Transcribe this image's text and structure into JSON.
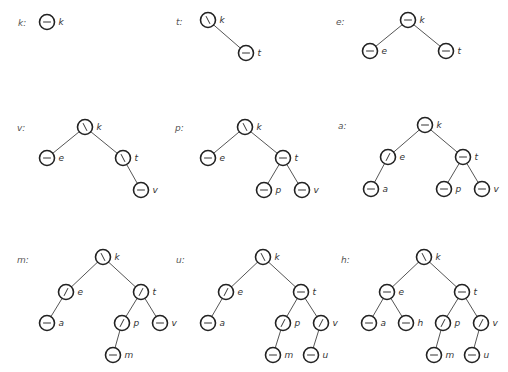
{
  "figure": {
    "balance_glyphs": {
      "balanced": "—",
      "left_heavy": "\\",
      "right_heavy": "/"
    },
    "panels": [
      {
        "label": "k:",
        "label_pos": [
          18,
          23
        ],
        "nodes": [
          {
            "key": "k",
            "x": 47,
            "y": 22,
            "balance": "balanced"
          }
        ],
        "edges": []
      },
      {
        "label": "t:",
        "label_pos": [
          176,
          22
        ],
        "nodes": [
          {
            "key": "k",
            "x": 208,
            "y": 20,
            "balance": "left_heavy"
          },
          {
            "key": "t",
            "x": 246,
            "y": 53,
            "balance": "balanced"
          }
        ],
        "edges": [
          [
            "k",
            "t"
          ]
        ]
      },
      {
        "label": "e:",
        "label_pos": [
          336,
          22
        ],
        "nodes": [
          {
            "key": "k",
            "x": 408,
            "y": 20,
            "balance": "balanced"
          },
          {
            "key": "e",
            "x": 370,
            "y": 51,
            "balance": "balanced"
          },
          {
            "key": "t",
            "x": 446,
            "y": 51,
            "balance": "balanced"
          }
        ],
        "edges": [
          [
            "k",
            "e"
          ],
          [
            "k",
            "t"
          ]
        ]
      },
      {
        "label": "v:",
        "label_pos": [
          17,
          128
        ],
        "nodes": [
          {
            "key": "k",
            "x": 85,
            "y": 127,
            "balance": "left_heavy"
          },
          {
            "key": "e",
            "x": 47,
            "y": 158,
            "balance": "balanced"
          },
          {
            "key": "t",
            "x": 123,
            "y": 158,
            "balance": "left_heavy"
          },
          {
            "key": "v",
            "x": 141,
            "y": 190,
            "balance": "balanced"
          }
        ],
        "edges": [
          [
            "k",
            "e"
          ],
          [
            "k",
            "t"
          ],
          [
            "t",
            "v"
          ]
        ]
      },
      {
        "label": "p:",
        "label_pos": [
          175,
          128
        ],
        "nodes": [
          {
            "key": "k",
            "x": 245,
            "y": 127,
            "balance": "left_heavy"
          },
          {
            "key": "e",
            "x": 208,
            "y": 158,
            "balance": "balanced"
          },
          {
            "key": "t",
            "x": 283,
            "y": 158,
            "balance": "balanced"
          },
          {
            "key": "p",
            "x": 264,
            "y": 190,
            "balance": "balanced"
          },
          {
            "key": "v",
            "x": 302,
            "y": 190,
            "balance": "balanced"
          }
        ],
        "edges": [
          [
            "k",
            "e"
          ],
          [
            "k",
            "t"
          ],
          [
            "t",
            "p"
          ],
          [
            "t",
            "v"
          ]
        ]
      },
      {
        "label": "a:",
        "label_pos": [
          338,
          126
        ],
        "nodes": [
          {
            "key": "k",
            "x": 425,
            "y": 125,
            "balance": "balanced"
          },
          {
            "key": "e",
            "x": 388,
            "y": 157,
            "balance": "right_heavy"
          },
          {
            "key": "t",
            "x": 463,
            "y": 157,
            "balance": "balanced"
          },
          {
            "key": "a",
            "x": 371,
            "y": 189,
            "balance": "balanced"
          },
          {
            "key": "p",
            "x": 444,
            "y": 189,
            "balance": "balanced"
          },
          {
            "key": "v",
            "x": 482,
            "y": 189,
            "balance": "balanced"
          }
        ],
        "edges": [
          [
            "k",
            "e"
          ],
          [
            "k",
            "t"
          ],
          [
            "e",
            "a"
          ],
          [
            "t",
            "p"
          ],
          [
            "t",
            "v"
          ]
        ]
      },
      {
        "label": "m:",
        "label_pos": [
          17,
          260
        ],
        "nodes": [
          {
            "key": "k",
            "x": 103,
            "y": 257,
            "balance": "left_heavy"
          },
          {
            "key": "e",
            "x": 66,
            "y": 292,
            "balance": "right_heavy"
          },
          {
            "key": "t",
            "x": 141,
            "y": 292,
            "balance": "right_heavy"
          },
          {
            "key": "a",
            "x": 47,
            "y": 323,
            "balance": "balanced"
          },
          {
            "key": "p",
            "x": 122,
            "y": 323,
            "balance": "right_heavy"
          },
          {
            "key": "v",
            "x": 160,
            "y": 323,
            "balance": "balanced"
          },
          {
            "key": "m",
            "x": 113,
            "y": 355,
            "balance": "balanced"
          }
        ],
        "edges": [
          [
            "k",
            "e"
          ],
          [
            "k",
            "t"
          ],
          [
            "e",
            "a"
          ],
          [
            "t",
            "p"
          ],
          [
            "t",
            "v"
          ],
          [
            "p",
            "m"
          ]
        ]
      },
      {
        "label": "u:",
        "label_pos": [
          176,
          260
        ],
        "nodes": [
          {
            "key": "k",
            "x": 263,
            "y": 257,
            "balance": "left_heavy"
          },
          {
            "key": "e",
            "x": 226,
            "y": 292,
            "balance": "right_heavy"
          },
          {
            "key": "t",
            "x": 301,
            "y": 292,
            "balance": "balanced"
          },
          {
            "key": "a",
            "x": 208,
            "y": 323,
            "balance": "balanced"
          },
          {
            "key": "p",
            "x": 283,
            "y": 323,
            "balance": "right_heavy"
          },
          {
            "key": "v",
            "x": 321,
            "y": 323,
            "balance": "right_heavy"
          },
          {
            "key": "m",
            "x": 273,
            "y": 355,
            "balance": "balanced"
          },
          {
            "key": "u",
            "x": 311,
            "y": 355,
            "balance": "balanced"
          }
        ],
        "edges": [
          [
            "k",
            "e"
          ],
          [
            "k",
            "t"
          ],
          [
            "e",
            "a"
          ],
          [
            "t",
            "p"
          ],
          [
            "t",
            "v"
          ],
          [
            "p",
            "m"
          ],
          [
            "v",
            "u"
          ]
        ]
      },
      {
        "label": "h:",
        "label_pos": [
          341,
          260
        ],
        "nodes": [
          {
            "key": "k",
            "x": 424,
            "y": 257,
            "balance": "left_heavy"
          },
          {
            "key": "e",
            "x": 387,
            "y": 292,
            "balance": "balanced"
          },
          {
            "key": "t",
            "x": 462,
            "y": 292,
            "balance": "balanced"
          },
          {
            "key": "a",
            "x": 369,
            "y": 323,
            "balance": "balanced"
          },
          {
            "key": "h",
            "x": 406,
            "y": 323,
            "balance": "balanced"
          },
          {
            "key": "p",
            "x": 443,
            "y": 323,
            "balance": "right_heavy"
          },
          {
            "key": "v",
            "x": 481,
            "y": 323,
            "balance": "right_heavy"
          },
          {
            "key": "m",
            "x": 434,
            "y": 355,
            "balance": "balanced"
          },
          {
            "key": "u",
            "x": 472,
            "y": 355,
            "balance": "balanced"
          }
        ],
        "edges": [
          [
            "k",
            "e"
          ],
          [
            "k",
            "t"
          ],
          [
            "e",
            "a"
          ],
          [
            "e",
            "h"
          ],
          [
            "t",
            "p"
          ],
          [
            "t",
            "v"
          ],
          [
            "p",
            "m"
          ],
          [
            "v",
            "u"
          ]
        ]
      }
    ]
  }
}
